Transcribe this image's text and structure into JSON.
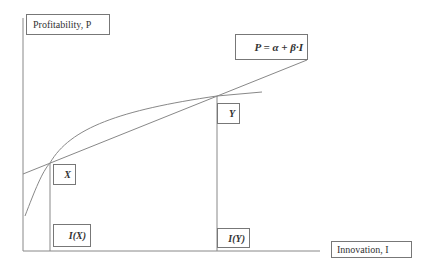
{
  "diagram": {
    "y_axis_label": "Profitability, P",
    "x_axis_label": "Innovation, I",
    "equation": "P = α + β·I",
    "point_x_label": "X",
    "point_y_label": "Y",
    "tick_x_label": "I(X)",
    "tick_y_label": "I(Y)",
    "line_color": "#888888"
  }
}
